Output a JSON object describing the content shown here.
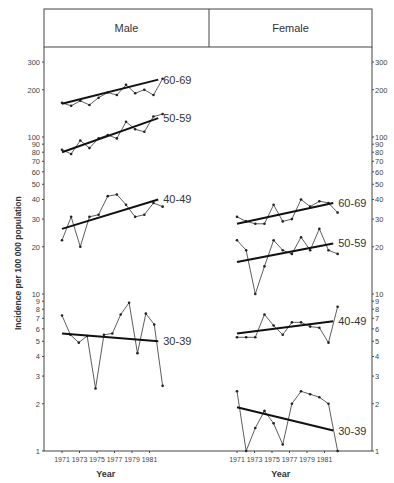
{
  "chart_data": {
    "type": "line",
    "title": "",
    "ylabel": "Incidence per 100 000 population",
    "xlabel": "Year",
    "yscale": "log",
    "ylim": [
      1,
      300
    ],
    "y_ticks": [
      1,
      2,
      3,
      4,
      5,
      6,
      7,
      8,
      9,
      10,
      20,
      30,
      40,
      50,
      60,
      70,
      80,
      90,
      100,
      200,
      300
    ],
    "x_ticks": [
      1971,
      1973,
      1975,
      1977,
      1979,
      1981
    ],
    "x": [
      1971,
      1972,
      1973,
      1974,
      1975,
      1976,
      1977,
      1978,
      1979,
      1980,
      1981,
      1982
    ],
    "panels": [
      {
        "name": "Male",
        "series": [
          {
            "name": "60-69",
            "values": [
              165,
              158,
              170,
              160,
              178,
              192,
              185,
              215,
              190,
              200,
              185,
              235
            ],
            "trend": [
              163,
              232
            ]
          },
          {
            "name": "50-59",
            "values": [
              83,
              78,
              95,
              85,
              98,
              103,
              98,
              125,
              112,
              108,
              135,
              140
            ],
            "trend": [
              80,
              132
            ]
          },
          {
            "name": "40-49",
            "values": [
              22,
              31,
              20,
              31,
              32,
              42,
              43,
              37,
              31,
              32,
              38,
              36
            ],
            "trend": [
              26,
              40
            ]
          },
          {
            "name": "30-39",
            "values": [
              7.3,
              5.5,
              4.9,
              5.4,
              2.5,
              5.5,
              5.6,
              7.4,
              8.8,
              4.2,
              7.5,
              6.4,
              2.6
            ],
            "trend": [
              5.6,
              5.0
            ]
          }
        ]
      },
      {
        "name": "Female",
        "series": [
          {
            "name": "60-69",
            "values": [
              31,
              29,
              28,
              28,
              37,
              29,
              30,
              40,
              36,
              39,
              38,
              33
            ],
            "trend": [
              28,
              38
            ]
          },
          {
            "name": "50-59",
            "values": [
              22,
              19,
              10,
              15,
              22,
              19,
              18,
              23,
              19,
              26,
              19,
              18
            ],
            "trend": [
              16,
              21
            ]
          },
          {
            "name": "40-49",
            "values": [
              5.3,
              5.3,
              5.3,
              7.4,
              6.3,
              5.5,
              6.6,
              6.6,
              6.2,
              6.1,
              4.9,
              8.3
            ],
            "trend": [
              5.6,
              6.7
            ]
          },
          {
            "name": "30-39",
            "values": [
              2.4,
              1.0,
              1.4,
              1.8,
              1.5,
              1.1,
              2.0,
              2.4,
              2.3,
              2.2,
              2.0,
              1.0
            ],
            "trend": [
              1.9,
              1.35
            ]
          }
        ]
      }
    ]
  },
  "headers": {
    "male": "Male",
    "female": "Female"
  }
}
